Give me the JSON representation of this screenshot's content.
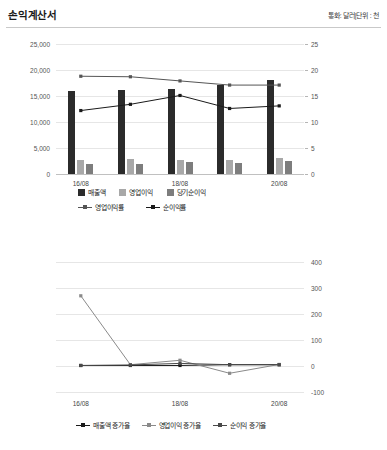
{
  "header": {
    "title": "손익계산서",
    "meta": "통화: 달러|단위 : 천"
  },
  "chart_data": [
    {
      "type": "bar",
      "title": "손익계산서",
      "xlabel": "",
      "ylabel": "",
      "categories": [
        "16/08",
        "17/08",
        "18/08",
        "19/08",
        "20/08"
      ],
      "visible_tick_labels": [
        "16/08",
        "",
        "18/08",
        "",
        "20/08"
      ],
      "ylim": [
        0,
        25000
      ],
      "yticks": [
        "0",
        "5,000",
        "10,000",
        "15,000",
        "20,000",
        "25,000"
      ],
      "y2lim": [
        0,
        25
      ],
      "y2ticks": [
        "0",
        "5",
        "10",
        "15",
        "20",
        "25"
      ],
      "grid": true,
      "legend_position": "bottom",
      "series": [
        {
          "name": "매출액",
          "kind": "bar",
          "axis": "left",
          "color": "#2b2b2b",
          "values": [
            16000,
            16100,
            16300,
            17200,
            18000
          ]
        },
        {
          "name": "영업이익",
          "kind": "bar",
          "axis": "left",
          "color": "#a8a8a8",
          "values": [
            2700,
            2800,
            2600,
            2650,
            3050
          ]
        },
        {
          "name": "당기순이익",
          "kind": "bar",
          "axis": "left",
          "color": "#7d7d7d",
          "values": [
            1950,
            1950,
            2400,
            2100,
            2450
          ]
        },
        {
          "name": "영업이익률",
          "kind": "line",
          "axis": "right",
          "color": "#555555",
          "values": [
            18.8,
            18.7,
            17.9,
            17.1,
            17.1
          ]
        },
        {
          "name": "순이익률",
          "kind": "line",
          "axis": "right",
          "color": "#1a1a1a",
          "values": [
            12.2,
            13.4,
            15.1,
            12.6,
            13.1
          ]
        }
      ]
    },
    {
      "type": "line",
      "title": "",
      "xlabel": "",
      "ylabel": "",
      "categories": [
        "16/08",
        "17/08",
        "18/08",
        "19/08",
        "20/08"
      ],
      "visible_tick_labels": [
        "16/08",
        "",
        "18/08",
        "",
        "20/08"
      ],
      "y2lim": [
        -100,
        400
      ],
      "y2ticks": [
        "-100",
        "0",
        "100",
        "200",
        "300",
        "400"
      ],
      "grid": true,
      "legend_position": "bottom",
      "series": [
        {
          "name": "매출액 증가율",
          "kind": "line",
          "color": "#1a1a1a",
          "values": [
            2,
            2,
            2,
            5,
            5
          ]
        },
        {
          "name": "영업이익 증가율",
          "kind": "line",
          "color": "#8a8a8a",
          "values": [
            270,
            5,
            22,
            -28,
            6
          ]
        },
        {
          "name": "순이익 증가율",
          "kind": "line",
          "color": "#4a4a4a",
          "values": [
            2,
            4,
            10,
            5,
            5
          ]
        }
      ]
    }
  ],
  "chart1": {
    "legend_row1": [
      {
        "label": "매출액",
        "color": "#2b2b2b"
      },
      {
        "label": "영업이익",
        "color": "#a8a8a8"
      },
      {
        "label": "당기순이익",
        "color": "#7d7d7d"
      }
    ],
    "legend_row2": [
      {
        "label": "영업이익률",
        "color": "#555555"
      },
      {
        "label": "순이익률",
        "color": "#1a1a1a"
      }
    ]
  },
  "chart2": {
    "legend": [
      {
        "label": "매출액 증가율",
        "color": "#1a1a1a"
      },
      {
        "label": "영업이익 증가율",
        "color": "#8a8a8a"
      },
      {
        "label": "순이익 증가율",
        "color": "#4a4a4a"
      }
    ]
  }
}
